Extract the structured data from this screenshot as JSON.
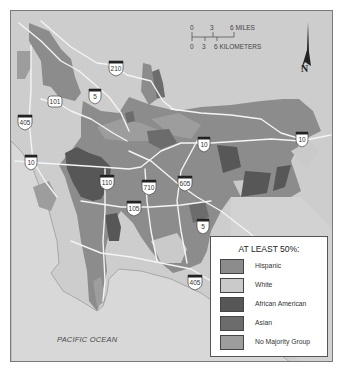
{
  "map": {
    "ocean_label": "PACIFIC OCEAN",
    "colors": {
      "background_white": "#cdcdcd",
      "ocean": "#d8d8d8",
      "hispanic": "#8c8c8c",
      "white": "#cacaca",
      "african_american": "#575757",
      "asian": "#6c6c6c",
      "no_majority": "#9d9d9d",
      "road": "#f4f4f4",
      "frame": "#7a7a7a"
    },
    "highway_shields": [
      {
        "label": "210",
        "type": "interstate"
      },
      {
        "label": "101",
        "type": "us"
      },
      {
        "label": "5",
        "type": "interstate"
      },
      {
        "label": "405",
        "type": "interstate"
      },
      {
        "label": "10",
        "type": "interstate"
      },
      {
        "label": "10",
        "type": "interstate"
      },
      {
        "label": "10",
        "type": "interstate"
      },
      {
        "label": "110",
        "type": "interstate"
      },
      {
        "label": "710",
        "type": "interstate"
      },
      {
        "label": "605",
        "type": "interstate"
      },
      {
        "label": "105",
        "type": "interstate"
      },
      {
        "label": "5",
        "type": "interstate"
      },
      {
        "label": "405",
        "type": "interstate"
      }
    ]
  },
  "scale_bar": {
    "miles_ticks": [
      "0",
      "3",
      "6 MILES"
    ],
    "km_ticks": [
      "0",
      "3",
      "6 KILOMETERS"
    ]
  },
  "north_arrow": {
    "label": "N"
  },
  "legend": {
    "title": "AT LEAST 50%:",
    "items": [
      {
        "label": "Hispanic",
        "color": "#8c8c8c"
      },
      {
        "label": "White",
        "color": "#cacaca"
      },
      {
        "label": "African American",
        "color": "#575757"
      },
      {
        "label": "Asian",
        "color": "#6c6c6c"
      },
      {
        "label": "No Majority Group",
        "color": "#9d9d9d"
      }
    ]
  }
}
